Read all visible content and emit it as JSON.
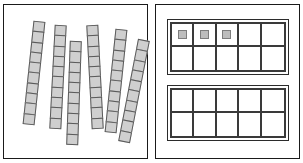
{
  "worksheet": {
    "title": "Base-ten rods and ten-frames",
    "background_color": "#ffffff",
    "panel_border_color": "#1a1a1a"
  },
  "left_panel": {
    "name": "base-ten-rods-panel",
    "rod_count": 6,
    "units_per_rod": 10,
    "total_units": 60,
    "unit_fill_color": "#cfcfcf",
    "unit_border_color": "#5a5a5a",
    "rods": [
      {
        "label": "rod-1",
        "units": 10,
        "left": 24,
        "top": 16,
        "width": 12,
        "height": 104,
        "rotation": 6
      },
      {
        "label": "rod-2",
        "units": 10,
        "left": 48,
        "top": 20,
        "width": 12,
        "height": 104,
        "rotation": 3
      },
      {
        "label": "rod-3",
        "units": 10,
        "left": 64,
        "top": 36,
        "width": 12,
        "height": 104,
        "rotation": 2
      },
      {
        "label": "rod-4",
        "units": 10,
        "left": 85,
        "top": 20,
        "width": 12,
        "height": 104,
        "rotation": -3
      },
      {
        "label": "rod-5",
        "units": 10,
        "left": 106,
        "top": 24,
        "width": 12,
        "height": 104,
        "rotation": 6
      },
      {
        "label": "rod-6",
        "units": 10,
        "left": 124,
        "top": 34,
        "width": 12,
        "height": 104,
        "rotation": 11
      }
    ]
  },
  "right_panel": {
    "name": "ten-frames-panel",
    "frame_count": 2,
    "cells_per_frame": 10,
    "counter_fill_color": "#bdbdbd",
    "counter_border_color": "#7d7d7d",
    "frames": [
      {
        "label": "ten-frame-top",
        "left": 11,
        "top": 14,
        "width": 122,
        "height": 56,
        "filled_count": 3,
        "cells": [
          {
            "index": 1,
            "row": 1,
            "col": 1,
            "filled": true
          },
          {
            "index": 2,
            "row": 1,
            "col": 2,
            "filled": true
          },
          {
            "index": 3,
            "row": 1,
            "col": 3,
            "filled": true
          },
          {
            "index": 4,
            "row": 1,
            "col": 4,
            "filled": false
          },
          {
            "index": 5,
            "row": 1,
            "col": 5,
            "filled": false
          },
          {
            "index": 6,
            "row": 2,
            "col": 1,
            "filled": false
          },
          {
            "index": 7,
            "row": 2,
            "col": 2,
            "filled": false
          },
          {
            "index": 8,
            "row": 2,
            "col": 3,
            "filled": false
          },
          {
            "index": 9,
            "row": 2,
            "col": 4,
            "filled": false
          },
          {
            "index": 10,
            "row": 2,
            "col": 5,
            "filled": false
          }
        ]
      },
      {
        "label": "ten-frame-bottom",
        "left": 11,
        "top": 80,
        "width": 122,
        "height": 56,
        "filled_count": 0,
        "cells": [
          {
            "index": 1,
            "row": 1,
            "col": 1,
            "filled": false
          },
          {
            "index": 2,
            "row": 1,
            "col": 2,
            "filled": false
          },
          {
            "index": 3,
            "row": 1,
            "col": 3,
            "filled": false
          },
          {
            "index": 4,
            "row": 1,
            "col": 4,
            "filled": false
          },
          {
            "index": 5,
            "row": 1,
            "col": 5,
            "filled": false
          },
          {
            "index": 6,
            "row": 2,
            "col": 1,
            "filled": false
          },
          {
            "index": 7,
            "row": 2,
            "col": 2,
            "filled": false
          },
          {
            "index": 8,
            "row": 2,
            "col": 3,
            "filled": false
          },
          {
            "index": 9,
            "row": 2,
            "col": 4,
            "filled": false
          },
          {
            "index": 10,
            "row": 2,
            "col": 5,
            "filled": false
          }
        ]
      }
    ]
  }
}
